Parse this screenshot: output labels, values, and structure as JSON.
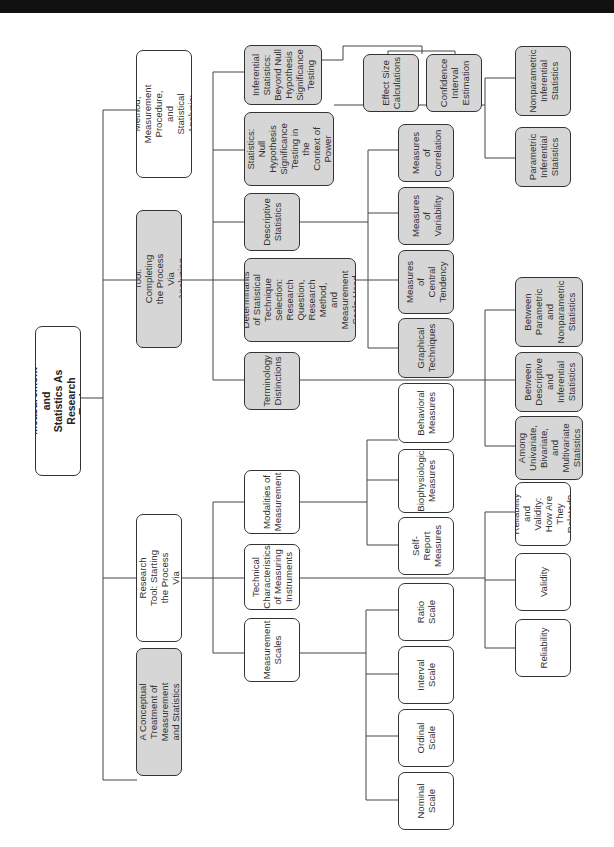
{
  "diagram": {
    "orientation": "rotated-90-ccw",
    "nodes": {
      "root": "Measurement and Statistics As\nResearch Tools",
      "rq": "Research Question, Research\nMethod, Measurement\nProcedure, and Statistical Analysis:\nA Logical and Critical Progression",
      "stat": "Statistics As a Research Tool:\nCompleting the Process Via\nAnalyzing Measurement Data",
      "meas": "Measurement As a Research\nTool: Starting the Process\nVia Generating Measures",
      "concept": "A Conceptual Treatment of\nMeasurement and Statistics",
      "beyond": "Inferential\nStatistics:\nBeyond Null\nHypothesis\nSignificance\nTesting",
      "nhst": "Inferential\nStatistics: Null\nHypothesis\nSignificance\nTesting in the\nContext of\nPower Analysis",
      "desc": "Descriptive\nStatistics",
      "determ": "Determinants\nof Statistical\nTechnique\nSelection:\nResearch\nQuestion,\nResearch Method,\nand Measurement\nScale Used",
      "term": "Terminology\nDistinctions",
      "effect": "Effect Size\nCalculations",
      "ci": "Confidence\nInterval\nEstimation",
      "corr": "Measures of\nCorrelation",
      "var": "Measures of\nVariability",
      "central": "Measures of\nCentral\nTendency",
      "graph": "Graphical\nTechniques",
      "nonparam": "Nonparametric\nInferential\nStatistics",
      "param": "Parametric\nInferential\nStatistics",
      "bw_pn": "Between\nParametric\nand\nNonparametric\nStatistics",
      "bw_di": "Between\nDescriptive\nand\nInferential\nStatistics",
      "among": "Among\nUnivariate,\nBivariate, and\nMultivariate\nStatistics",
      "modal": "Modalities of\nMeasurement",
      "tech": "Technical\nCharacteristics\nof Measuring\nInstruments",
      "scales": "Measurement\nScales",
      "behav": "Behavioral\nMeasures",
      "bio": "Biophysiologic\nMeasures",
      "self": "Self-Report\nMeasures",
      "ratio": "Ratio\nScale",
      "interval": "Interval\nScale",
      "ordinal": "Ordinal\nScale",
      "nominal": "Nominal\nScale",
      "relval": "Reliability\nand Validity:\nHow Are\nThey Related?",
      "validity": "Validity",
      "reliability": "Reliability"
    },
    "tree": {
      "root": [
        "rq",
        "stat",
        "meas",
        "concept"
      ],
      "stat": [
        "beyond",
        "nhst",
        "desc",
        "determ",
        "term"
      ],
      "beyond": [
        "effect",
        "ci"
      ],
      "desc": [
        "corr",
        "var",
        "central",
        "graph"
      ],
      "nhst": [
        "nonparam",
        "param"
      ],
      "term": [
        "bw_pn",
        "bw_di",
        "among"
      ],
      "meas": [
        "modal",
        "tech",
        "scales"
      ],
      "modal": [
        "behav",
        "bio",
        "self"
      ],
      "scales": [
        "ratio",
        "interval",
        "ordinal",
        "nominal"
      ],
      "tech": [
        "relval",
        "validity",
        "reliability"
      ]
    },
    "colors": {
      "gray_fill": "#d6d6d6",
      "white_fill": "#ffffff",
      "stroke": "#333333"
    }
  }
}
